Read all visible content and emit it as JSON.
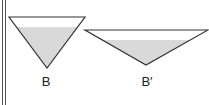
{
  "colors": {
    "stroke": "#333333",
    "fill": "#d9d9d9",
    "background": "#ffffff",
    "border": "#555555"
  },
  "triangles": [
    {
      "id": "B",
      "label": "B",
      "vertices": [
        [
          9,
          17
        ],
        [
          85,
          17
        ],
        [
          47,
          68
        ]
      ],
      "fill_top_y": 27,
      "label_pos": [
        46,
        74
      ]
    },
    {
      "id": "B_prime",
      "label": "B′",
      "vertices": [
        [
          85,
          30
        ],
        [
          208,
          30
        ],
        [
          146,
          65
        ]
      ],
      "fill_top_y": 40,
      "label_pos": [
        146,
        74
      ]
    }
  ]
}
